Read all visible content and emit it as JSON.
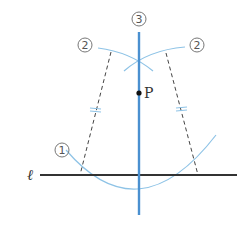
{
  "diagram": {
    "labels": {
      "step1": "①",
      "step2_left": "②",
      "step2_right": "②",
      "step3": "③",
      "point": "P",
      "line": "ℓ"
    },
    "colors": {
      "perpendicular": "#4a90d0",
      "arc": "#8ec3e6",
      "line": "#333333",
      "dashed": "#444444",
      "label_circle": "#777777"
    },
    "elements": [
      {
        "id": "line-l",
        "type": "line",
        "from": [
          40,
          175
        ],
        "to": [
          237,
          175
        ]
      },
      {
        "id": "perpendicular-3",
        "type": "line",
        "from": [
          139,
          32
        ],
        "to": [
          139,
          215
        ]
      },
      {
        "id": "arc-1",
        "type": "arc",
        "center": "P",
        "passes": [
          [
            66,
            162
          ],
          [
            139,
            195
          ],
          [
            214,
            158
          ]
        ]
      },
      {
        "id": "arc-2-left",
        "type": "arc",
        "from": [
          98,
          48
        ],
        "to": [
          152,
          70
        ]
      },
      {
        "id": "arc-2-right",
        "type": "arc",
        "from": [
          125,
          70
        ],
        "to": [
          185,
          46
        ]
      },
      {
        "id": "dashed-left",
        "type": "dashed-line",
        "from": [
          111,
          50
        ],
        "to": [
          80,
          175
        ]
      },
      {
        "id": "dashed-right",
        "type": "dashed-line",
        "from": [
          166,
          52
        ],
        "to": [
          198,
          175
        ]
      },
      {
        "id": "point-P",
        "type": "point",
        "at": [
          139,
          93
        ]
      }
    ]
  }
}
